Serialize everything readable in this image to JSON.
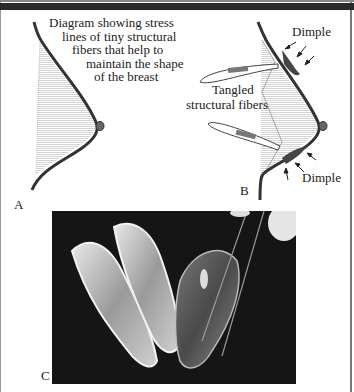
{
  "figure": {
    "panel_a": {
      "label": "A",
      "caption_lines": [
        "Diagram showing stress",
        "lines of tiny structural",
        "fibers that help to",
        "maintain the shape",
        "of the breast"
      ]
    },
    "panel_b": {
      "label": "B",
      "annotations": {
        "dimple_top": "Dimple",
        "dimple_bottom": "Dimple",
        "fibers_line1": "Tangled",
        "fibers_line2": "structural fibers"
      }
    },
    "panel_c": {
      "label": "C",
      "description": "Photograph of orange segments held with forceps on dark background"
    },
    "colors": {
      "outline": "#333333",
      "fiber_lines": "#9a9a9a",
      "photo_bg": "#151515",
      "border": "#2a2a2a"
    }
  }
}
